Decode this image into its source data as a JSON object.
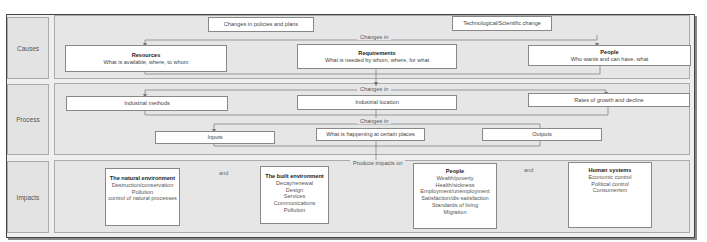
{
  "rows": {
    "causes": {
      "label": "Causes",
      "drivers": [
        "Changes in policies and plans",
        "Technological/Scientific change"
      ],
      "connector": "Changes in",
      "boxes": [
        {
          "title": "Resources",
          "subtitle": "What is available, where, to whom"
        },
        {
          "title": "Requirements",
          "subtitle": "What is needed by whom, where, for what"
        },
        {
          "title": "People",
          "subtitle": "Who wants and can have, what"
        }
      ]
    },
    "process": {
      "label": "Process",
      "connector_1": "Changes in",
      "boxes_1": [
        "Industrial methods",
        "Industrial location",
        "Rates of growth and decline"
      ],
      "connector_2": "Changes in",
      "boxes_2": [
        "Inputs",
        "What is happening at certain places",
        "Outputs"
      ]
    },
    "impacts": {
      "label": "Impacts",
      "connector": "Produce impacts on",
      "and_label": "and",
      "boxes": [
        {
          "title": "The natural environment",
          "items": [
            "Destruction/conservation",
            "Pollution",
            "control of natural processes"
          ]
        },
        {
          "title": "The built environment",
          "items": [
            "Decay/renewal",
            "Design",
            "Services",
            "Communications",
            "Pollution"
          ]
        },
        {
          "title": "People",
          "items": [
            "Wealth/poverty",
            "Health/sickness",
            "Employment/unemployment",
            "Satisfaction/dis-satisfaction",
            "Standards of living",
            "Migration"
          ]
        },
        {
          "title": "Human systems",
          "items": [
            "Economic control",
            "Political control",
            "Consumerism"
          ]
        }
      ]
    }
  },
  "colors": {
    "frame": "#444444",
    "panel": "#e6e6e6",
    "box": "#ffffff",
    "line": "#777777"
  }
}
